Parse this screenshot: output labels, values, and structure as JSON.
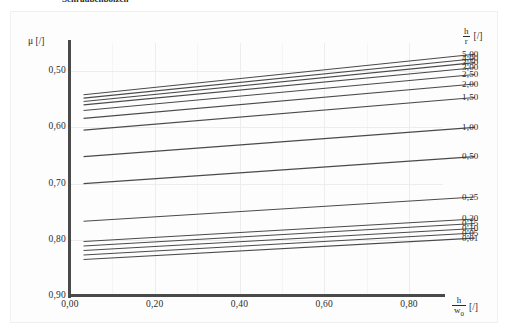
{
  "caption": {
    "text": "Schraubenbolzen"
  },
  "axes": {
    "y_label_mu": "μ",
    "y_label_unit": "[/]",
    "y_ticks": [
      "0,90",
      "0,80",
      "0,70",
      "0,60",
      "0,50"
    ],
    "x_ticks": [
      "0,00",
      "0,20",
      "0,40",
      "0,60",
      "0,80"
    ],
    "x_label_num": "h",
    "x_label_den": "w",
    "x_label_den_sub": "0",
    "x_label_unit": "[/]"
  },
  "legend": {
    "title_num": "h",
    "title_den": "r",
    "title_unit": "[/]",
    "labels": [
      "5,00",
      "4,00",
      "3,50",
      "3,00",
      "2,50",
      "2,00",
      "1,50",
      "1,00",
      "0,50",
      "0,25",
      "0,20",
      "0,15",
      "0,10",
      "0,05",
      "0,01"
    ]
  },
  "chart_data": {
    "type": "line",
    "title": "Schraubenbolzen",
    "xlabel": "h/w0 [/]",
    "ylabel": "mu [/]",
    "xlim": [
      0.0,
      0.88
    ],
    "ylim": [
      0.5,
      0.95
    ],
    "xticks": [
      0.0,
      0.2,
      0.4,
      0.6,
      0.8
    ],
    "yticks": [
      0.5,
      0.6,
      0.7,
      0.8,
      0.9
    ],
    "grid": true,
    "legend_position": "right",
    "legend_title": "h/r [/]",
    "x_start": 0.032,
    "x_end": 0.955,
    "series": [
      {
        "name": "5,00",
        "h_over_r": 5.0,
        "y_start": 0.858,
        "y_end": 0.93
      },
      {
        "name": "4,00",
        "h_over_r": 4.0,
        "y_start": 0.852,
        "y_end": 0.922
      },
      {
        "name": "3,50",
        "h_over_r": 3.5,
        "y_start": 0.846,
        "y_end": 0.915
      },
      {
        "name": "3,00",
        "h_over_r": 3.0,
        "y_start": 0.84,
        "y_end": 0.906
      },
      {
        "name": "2,50",
        "h_over_r": 2.5,
        "y_start": 0.83,
        "y_end": 0.894
      },
      {
        "name": "2,00",
        "h_over_r": 2.0,
        "y_start": 0.816,
        "y_end": 0.877
      },
      {
        "name": "1,50",
        "h_over_r": 1.5,
        "y_start": 0.795,
        "y_end": 0.853
      },
      {
        "name": "1,00",
        "h_over_r": 1.0,
        "y_start": 0.748,
        "y_end": 0.8
      },
      {
        "name": "0,50",
        "h_over_r": 0.5,
        "y_start": 0.7,
        "y_end": 0.748
      },
      {
        "name": "0,25",
        "h_over_r": 0.25,
        "y_start": 0.633,
        "y_end": 0.676
      },
      {
        "name": "0,20",
        "h_over_r": 0.2,
        "y_start": 0.597,
        "y_end": 0.637
      },
      {
        "name": "0,15",
        "h_over_r": 0.15,
        "y_start": 0.589,
        "y_end": 0.629
      },
      {
        "name": "0,10",
        "h_over_r": 0.1,
        "y_start": 0.581,
        "y_end": 0.62
      },
      {
        "name": "0,05",
        "h_over_r": 0.05,
        "y_start": 0.573,
        "y_end": 0.612
      },
      {
        "name": "0,01",
        "h_over_r": 0.01,
        "y_start": 0.565,
        "y_end": 0.603
      }
    ]
  }
}
